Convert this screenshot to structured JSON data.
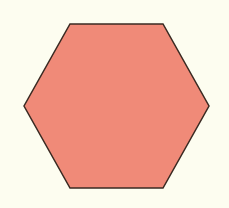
{
  "canvas": {
    "width": 229,
    "height": 208,
    "background": "#fdfdf0"
  },
  "shapes": [
    {
      "type": "hexagon",
      "points": "70,24 163,24 209,106 163,188 70,188 24,106",
      "fill": "#f08a78",
      "stroke": "#3a2a22",
      "stroke_width": 1.5
    }
  ]
}
